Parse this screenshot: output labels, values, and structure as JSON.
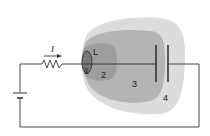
{
  "diagram": {
    "type": "glow-discharge-regions",
    "current_label": "I",
    "cathode_label": "L",
    "regions": [
      {
        "id": 1,
        "label": "1",
        "color": "#7a7a7a"
      },
      {
        "id": 2,
        "label": "2",
        "color": "#9c9c9c"
      },
      {
        "id": 3,
        "label": "3",
        "color": "#b8b8b8"
      },
      {
        "id": 4,
        "label": "4",
        "color": "#dcdcdc"
      }
    ],
    "colors": {
      "wire": "#333333",
      "plate": "#222222",
      "background": "#ffffff"
    }
  }
}
